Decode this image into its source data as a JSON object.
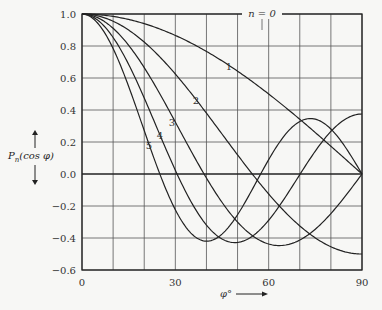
{
  "chart_data": {
    "type": "line",
    "title": "",
    "xlabel": "φ°",
    "ylabel": "P_n(cos φ)",
    "xlim": [
      0,
      90
    ],
    "ylim": [
      -0.6,
      1.0
    ],
    "grid": true,
    "x_ticks": [
      0,
      30,
      60,
      90
    ],
    "x_gridlines": [
      0,
      10,
      20,
      30,
      40,
      50,
      60,
      70,
      80,
      90
    ],
    "y_ticks": [
      1.0,
      0.8,
      0.6,
      0.4,
      0.2,
      0.0,
      -0.2,
      -0.4,
      -0.6
    ],
    "y_tick_labels": [
      "1.0",
      "0.8",
      "0.6",
      "0.4",
      "0.2",
      "0.0",
      "−0.2",
      "−0.4",
      "−0.6"
    ],
    "x": [
      0,
      10,
      20,
      30,
      40,
      50,
      60,
      70,
      80,
      90
    ],
    "series": [
      {
        "name": "n = 0",
        "label": "n = 0",
        "values": [
          1,
          1,
          1,
          1,
          1,
          1,
          1,
          1,
          1,
          1
        ]
      },
      {
        "name": "n = 1",
        "label": "1",
        "values": [
          1.0,
          0.985,
          0.94,
          0.866,
          0.766,
          0.643,
          0.5,
          0.342,
          0.174,
          0.0
        ]
      },
      {
        "name": "n = 2",
        "label": "2",
        "values": [
          1.0,
          0.955,
          0.824,
          0.625,
          0.38,
          0.12,
          -0.125,
          -0.325,
          -0.455,
          -0.5
        ]
      },
      {
        "name": "n = 3",
        "label": "3",
        "values": [
          1.0,
          0.911,
          0.665,
          0.325,
          -0.025,
          -0.3,
          -0.438,
          -0.413,
          -0.247,
          0.0
        ]
      },
      {
        "name": "n = 4",
        "label": "4",
        "values": [
          1.0,
          0.853,
          0.475,
          0.023,
          -0.319,
          -0.428,
          -0.289,
          0.009,
          0.288,
          0.375
        ]
      },
      {
        "name": "n = 5",
        "label": "5",
        "values": [
          1.0,
          0.784,
          0.265,
          -0.253,
          -0.419,
          -0.225,
          0.09,
          0.3,
          0.227,
          0.0
        ]
      }
    ],
    "annotations": [
      "n = 0",
      "1",
      "2",
      "3",
      "4",
      "5"
    ]
  },
  "axis": {
    "ylabel_main": "P",
    "ylabel_sub": "n",
    "ylabel_rest": "(cos φ)",
    "xlabel": "φ°"
  }
}
